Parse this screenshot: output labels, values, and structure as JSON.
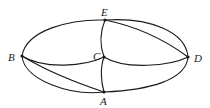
{
  "diagram": {
    "type": "multigraph",
    "nodes": [
      {
        "id": "E",
        "label": "E",
        "x": 105,
        "y": 20,
        "lx": 102,
        "ly": 16
      },
      {
        "id": "B",
        "label": "B",
        "x": 22,
        "y": 56,
        "lx": 9,
        "ly": 61
      },
      {
        "id": "C",
        "label": "C",
        "x": 104,
        "y": 57,
        "lx": 93,
        "ly": 60
      },
      {
        "id": "D",
        "label": "D",
        "x": 188,
        "y": 57,
        "lx": 194,
        "ly": 62
      },
      {
        "id": "A",
        "label": "A",
        "x": 104,
        "y": 92,
        "lx": 101,
        "ly": 105
      }
    ],
    "edges": [
      {
        "from": "B",
        "to": "E",
        "kind": "outer-arc"
      },
      {
        "from": "E",
        "to": "D",
        "kind": "outer-arc"
      },
      {
        "from": "E",
        "to": "D",
        "kind": "chord"
      },
      {
        "from": "E",
        "to": "C",
        "kind": "curve"
      },
      {
        "from": "B",
        "to": "C",
        "kind": "curve"
      },
      {
        "from": "C",
        "to": "D",
        "kind": "curve"
      },
      {
        "from": "C",
        "to": "A",
        "kind": "curve"
      },
      {
        "from": "B",
        "to": "A",
        "kind": "chord"
      },
      {
        "from": "B",
        "to": "A",
        "kind": "outer-arc"
      },
      {
        "from": "A",
        "to": "D",
        "kind": "outer-arc"
      }
    ]
  }
}
